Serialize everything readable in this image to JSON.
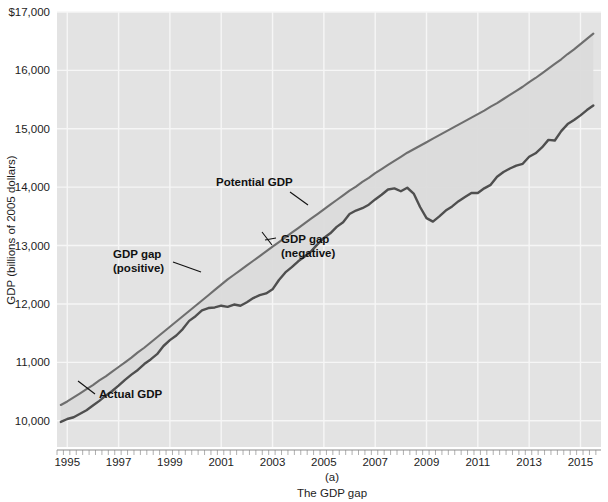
{
  "figure": {
    "caption_letter": "(a)",
    "caption_text": "The GDP gap",
    "background_color": "#e3e3e3",
    "grid_color": "#f4f4f4",
    "line_color": "#585858",
    "potential_line_color": "#6e6e6e",
    "gap_fill_color": "#dcdcdc"
  },
  "axes": {
    "y_title": "GDP (billions of 2005 dollars)",
    "y_ticks": [
      "$17,000",
      "16,000",
      "15,000",
      "14,000",
      "13,000",
      "12,000",
      "11,000",
      "10,000"
    ],
    "y_tick_values": [
      17000,
      16000,
      15000,
      14000,
      13000,
      12000,
      11000,
      10000
    ],
    "x_ticks": [
      "1995",
      "1997",
      "1999",
      "2001",
      "2003",
      "2005",
      "2007",
      "2009",
      "2011",
      "2013",
      "2015"
    ],
    "x_tick_values": [
      1995,
      1997,
      1999,
      2001,
      2003,
      2005,
      2007,
      2009,
      2011,
      2013,
      2015
    ]
  },
  "annotations": [
    {
      "id": "potential-gdp",
      "line1": "Potential GDP",
      "line2": ""
    },
    {
      "id": "gdp-gap-positive",
      "line1": "GDP gap",
      "line2": "(positive)"
    },
    {
      "id": "gdp-gap-negative",
      "line1": "GDP gap",
      "line2": "(negative)"
    },
    {
      "id": "actual-gdp",
      "line1": "Actual GDP",
      "line2": ""
    }
  ],
  "chart_data": {
    "type": "line",
    "title": "The GDP gap",
    "xlabel": "",
    "ylabel": "GDP (billions of 2005 dollars)",
    "xlim": [
      1994.6,
      2015.8
    ],
    "ylim": [
      9550,
      17000
    ],
    "grid": true,
    "legend": "annotated-inline",
    "x": [
      1994.75,
      1995.0,
      1995.25,
      1995.5,
      1995.75,
      1996.0,
      1996.25,
      1996.5,
      1996.75,
      1997.0,
      1997.25,
      1997.5,
      1997.75,
      1998.0,
      1998.25,
      1998.5,
      1998.75,
      1999.0,
      1999.25,
      1999.5,
      1999.75,
      2000.0,
      2000.25,
      2000.5,
      2000.75,
      2001.0,
      2001.25,
      2001.5,
      2001.75,
      2002.0,
      2002.25,
      2002.5,
      2002.75,
      2003.0,
      2003.25,
      2003.5,
      2003.75,
      2004.0,
      2004.25,
      2004.5,
      2004.75,
      2005.0,
      2005.25,
      2005.5,
      2005.75,
      2006.0,
      2006.25,
      2006.5,
      2006.75,
      2007.0,
      2007.25,
      2007.5,
      2007.75,
      2008.0,
      2008.25,
      2008.5,
      2008.75,
      2009.0,
      2009.25,
      2009.5,
      2009.75,
      2010.0,
      2010.25,
      2010.5,
      2010.75,
      2011.0,
      2011.25,
      2011.5,
      2011.75,
      2012.0,
      2012.25,
      2012.5,
      2012.75,
      2013.0,
      2013.25,
      2013.5,
      2013.75,
      2014.0,
      2014.25,
      2014.5,
      2014.75,
      2015.0,
      2015.25,
      2015.5
    ],
    "series": [
      {
        "name": "Actual GDP",
        "color": "#585858",
        "values": [
          9980,
          10030,
          10060,
          10120,
          10180,
          10260,
          10340,
          10430,
          10510,
          10600,
          10700,
          10790,
          10870,
          10970,
          11050,
          11140,
          11280,
          11380,
          11460,
          11570,
          11710,
          11790,
          11890,
          11930,
          11940,
          11970,
          11950,
          11990,
          11970,
          12030,
          12100,
          12150,
          12180,
          12250,
          12410,
          12540,
          12630,
          12730,
          12810,
          12900,
          13020,
          13130,
          13210,
          13320,
          13400,
          13540,
          13600,
          13640,
          13700,
          13790,
          13870,
          13960,
          13980,
          13930,
          13990,
          13890,
          13660,
          13470,
          13410,
          13500,
          13600,
          13670,
          13760,
          13830,
          13900,
          13900,
          13980,
          14040,
          14180,
          14260,
          14320,
          14370,
          14400,
          14520,
          14580,
          14680,
          14810,
          14800,
          14960,
          15080,
          15150,
          15230,
          15320,
          15400
        ]
      },
      {
        "name": "Potential GDP",
        "color": "#6e6e6e",
        "values": [
          10270,
          10330,
          10400,
          10470,
          10540,
          10610,
          10690,
          10760,
          10840,
          10920,
          11000,
          11080,
          11170,
          11250,
          11340,
          11430,
          11520,
          11610,
          11700,
          11790,
          11880,
          11970,
          12060,
          12150,
          12240,
          12330,
          12420,
          12500,
          12580,
          12660,
          12740,
          12820,
          12900,
          12980,
          13060,
          13140,
          13220,
          13300,
          13380,
          13460,
          13540,
          13620,
          13700,
          13780,
          13860,
          13940,
          14010,
          14090,
          14160,
          14240,
          14310,
          14380,
          14450,
          14520,
          14590,
          14650,
          14710,
          14770,
          14830,
          14890,
          14950,
          15010,
          15070,
          15130,
          15190,
          15250,
          15310,
          15380,
          15440,
          15510,
          15580,
          15650,
          15720,
          15800,
          15870,
          15950,
          16030,
          16110,
          16190,
          16280,
          16360,
          16450,
          16540,
          16630
        ]
      }
    ],
    "annotations": [
      {
        "text": "Potential GDP",
        "x": 2002.4,
        "y": 13950
      },
      {
        "text": "GDP gap (positive)",
        "x": 1999.2,
        "y": 12450
      },
      {
        "text": "GDP gap (negative)",
        "x": 2003.4,
        "y": 13050
      },
      {
        "text": "Actual GDP",
        "x": 1996.4,
        "y": 10100
      }
    ]
  }
}
